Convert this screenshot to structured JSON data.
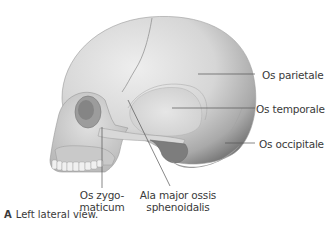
{
  "figure": {
    "labels": {
      "os_parietale": "Os parietale",
      "os_temporale": "Os temporale",
      "os_occipitale": "Os occipitale",
      "os_zygomaticum_line1": "Os zygo-",
      "os_zygomaticum_line2": "maticum",
      "ala_major_line1": "Ala major ossis",
      "ala_major_line2": "sphenoidalis"
    },
    "caption": {
      "letter": "A",
      "text": "Left lateral view."
    },
    "colors": {
      "bone_light": "#e4e4e4",
      "bone_mid": "#c8c8c8",
      "bone_dark": "#8a8a8a",
      "leader_line": "#555555",
      "text": "#3a3a3a"
    }
  }
}
